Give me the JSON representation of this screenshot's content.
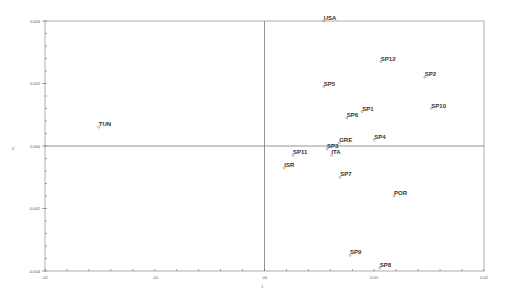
{
  "chart_data": {
    "type": "scatter",
    "title": "",
    "xlabel": "1",
    "ylabel": "2",
    "xlim": [
      -0.02,
      0.02
    ],
    "ylim": [
      -0.004,
      0.004
    ],
    "x_ticks": [
      -0.02,
      -0.01,
      0.0,
      0.01,
      0.02
    ],
    "x_tick_labels": [
      ".02",
      "-.01",
      ".00",
      "0.01",
      "0.02"
    ],
    "y_ticks": [
      0.004,
      0.002,
      0.0,
      -0.002,
      -0.004
    ],
    "y_tick_labels": [
      "0.004",
      "0.002",
      "0.000",
      "-0.002",
      "-0.004"
    ],
    "reference_lines": {
      "x": 0.0,
      "y": 0.0
    },
    "grid": false,
    "legend": "none",
    "points": [
      {
        "label": "USA",
        "x": 0.0054,
        "y": 0.004
      },
      {
        "label": "SP12",
        "x": 0.0106,
        "y": 0.0027
      },
      {
        "label": "SP2",
        "x": 0.0146,
        "y": 0.0022
      },
      {
        "label": "SP5",
        "x": 0.0054,
        "y": 0.0019
      },
      {
        "label": "SP1",
        "x": 0.0089,
        "y": 0.0011
      },
      {
        "label": "SP10",
        "x": 0.0152,
        "y": 0.0012
      },
      {
        "label": "SP6",
        "x": 0.0075,
        "y": 0.0009
      },
      {
        "label": "TUN",
        "x": -0.0151,
        "y": 0.0006
      },
      {
        "label": "SP4",
        "x": 0.01,
        "y": 0.0002
      },
      {
        "label": "GRE",
        "x": 0.0068,
        "y": 0.0001
      },
      {
        "label": "SP3",
        "x": 0.0057,
        "y": -0.0001
      },
      {
        "label": "SP11",
        "x": 0.0026,
        "y": -0.0003
      },
      {
        "label": "ITA",
        "x": 0.0061,
        "y": -0.0003
      },
      {
        "label": "ISR",
        "x": 0.0018,
        "y": -0.0007
      },
      {
        "label": "SP7",
        "x": 0.0069,
        "y": -0.001
      },
      {
        "label": "POR",
        "x": 0.0118,
        "y": -0.0016
      },
      {
        "label": "SP9",
        "x": 0.0078,
        "y": -0.0035
      },
      {
        "label": "SP8",
        "x": 0.0105,
        "y": -0.0039
      }
    ]
  }
}
